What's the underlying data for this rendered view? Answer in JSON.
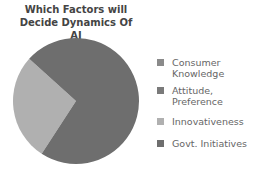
{
  "chart_data": {
    "type": "pie",
    "title": "Which Factors will Decide Dynamics Of AI",
    "title_lines": [
      "Which Factors will",
      "Decide Dynamics Of AI"
    ],
    "categories": [
      "Consumer Knowledge",
      "Attitude, Preference",
      "Innovativeness",
      "Govt. Initiatives"
    ],
    "values": [
      0,
      0,
      27.5,
      72.5
    ],
    "colors": [
      "#8a8a8a",
      "#7a7a7a",
      "#b0b0b0",
      "#6e6e6e"
    ],
    "legend_position": "right",
    "legend": [
      {
        "lines": [
          "Consumer",
          "Knowledge"
        ],
        "color": "#8a8a8a"
      },
      {
        "lines": [
          "Attitude,",
          "Preference"
        ],
        "color": "#7a7a7a"
      },
      {
        "lines": [
          "Innovativeness"
        ],
        "color": "#b0b0b0"
      },
      {
        "lines": [
          "Govt. Initiatives"
        ],
        "color": "#6e6e6e"
      }
    ]
  }
}
